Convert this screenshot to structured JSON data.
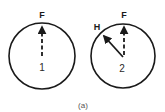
{
  "figure": {
    "caption": "(a)",
    "colors": {
      "stroke": "#1a1a1a",
      "background": "#ffffff"
    },
    "diagrams": [
      {
        "id": "1",
        "center_label": "1",
        "vectors": [
          {
            "label": "F",
            "direction": "up",
            "style": "dashed-with-arrowhead"
          }
        ]
      },
      {
        "id": "2",
        "center_label": "2",
        "vectors": [
          {
            "label": "F",
            "direction": "up",
            "style": "dashed-with-arrowhead"
          },
          {
            "label": "H",
            "direction": "up-left",
            "style": "solid-with-arrowhead"
          }
        ]
      }
    ]
  }
}
